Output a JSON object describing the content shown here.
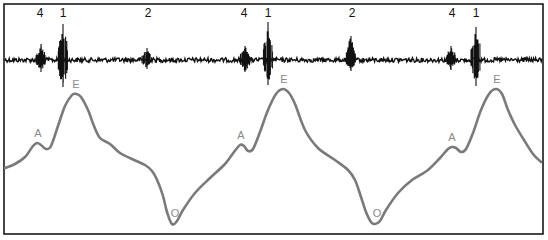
{
  "figure": {
    "frame": {
      "left": 4,
      "top": 4,
      "right": 543,
      "bottom": 234,
      "color": "#1a1a1a"
    },
    "trace": {
      "baseline_y": 60,
      "color": "#111111",
      "bursts": [
        {
          "label": "4",
          "x": 41,
          "amp_up": 16,
          "amp_down": 12
        },
        {
          "label": "1",
          "x": 63,
          "amp_up": 36,
          "amp_down": 27
        },
        {
          "label": "2",
          "x": 147,
          "amp_up": 12,
          "amp_down": 9
        },
        {
          "label": "4",
          "x": 245,
          "amp_up": 14,
          "amp_down": 12
        },
        {
          "label": "1",
          "x": 268,
          "amp_up": 38,
          "amp_down": 25
        },
        {
          "label": "2",
          "x": 351,
          "amp_up": 24,
          "amp_down": 11
        },
        {
          "label": "4",
          "x": 451,
          "amp_up": 14,
          "amp_down": 10
        },
        {
          "label": "1",
          "x": 476,
          "amp_up": 33,
          "amp_down": 26
        }
      ],
      "labels": [
        {
          "text": "4",
          "x": 40,
          "y": 17
        },
        {
          "text": "1",
          "x": 63,
          "y": 17
        },
        {
          "text": "2",
          "x": 148,
          "y": 17
        },
        {
          "text": "4",
          "x": 244,
          "y": 17
        },
        {
          "text": "1",
          "x": 268,
          "y": 17
        },
        {
          "text": "2",
          "x": 352,
          "y": 17
        },
        {
          "text": "4",
          "x": 452,
          "y": 17
        },
        {
          "text": "1",
          "x": 476,
          "y": 17
        }
      ]
    },
    "wave": {
      "color": "#7a7a7a",
      "stroke_width": 2.6,
      "points": [
        [
          5,
          168
        ],
        [
          15,
          164
        ],
        [
          25,
          157
        ],
        [
          33,
          146
        ],
        [
          37,
          143
        ],
        [
          41,
          145
        ],
        [
          46,
          149
        ],
        [
          51,
          146
        ],
        [
          58,
          126
        ],
        [
          65,
          106
        ],
        [
          72,
          95
        ],
        [
          76,
          94
        ],
        [
          81,
          97
        ],
        [
          88,
          110
        ],
        [
          94,
          126
        ],
        [
          100,
          138
        ],
        [
          110,
          144
        ],
        [
          120,
          153
        ],
        [
          132,
          159
        ],
        [
          145,
          165
        ],
        [
          152,
          171
        ],
        [
          158,
          182
        ],
        [
          163,
          196
        ],
        [
          167,
          212
        ],
        [
          172,
          224
        ],
        [
          177,
          221
        ],
        [
          183,
          210
        ],
        [
          195,
          193
        ],
        [
          210,
          178
        ],
        [
          225,
          164
        ],
        [
          234,
          152
        ],
        [
          240,
          145
        ],
        [
          244,
          146
        ],
        [
          248,
          151
        ],
        [
          253,
          149
        ],
        [
          260,
          132
        ],
        [
          268,
          110
        ],
        [
          276,
          94
        ],
        [
          283,
          89
        ],
        [
          289,
          93
        ],
        [
          295,
          104
        ],
        [
          305,
          130
        ],
        [
          318,
          148
        ],
        [
          335,
          160
        ],
        [
          348,
          170
        ],
        [
          355,
          180
        ],
        [
          361,
          197
        ],
        [
          366,
          212
        ],
        [
          371,
          222
        ],
        [
          375,
          224
        ],
        [
          380,
          221
        ],
        [
          386,
          210
        ],
        [
          398,
          193
        ],
        [
          412,
          180
        ],
        [
          428,
          170
        ],
        [
          440,
          158
        ],
        [
          448,
          149
        ],
        [
          452,
          147
        ],
        [
          456,
          148
        ],
        [
          461,
          152
        ],
        [
          466,
          149
        ],
        [
          473,
          133
        ],
        [
          481,
          110
        ],
        [
          489,
          94
        ],
        [
          496,
          89
        ],
        [
          502,
          94
        ],
        [
          508,
          110
        ],
        [
          515,
          125
        ],
        [
          524,
          140
        ],
        [
          533,
          154
        ],
        [
          541,
          162
        ]
      ],
      "labels": [
        {
          "text": "A",
          "x": 38,
          "y": 137
        },
        {
          "text": "E",
          "x": 76,
          "y": 88
        },
        {
          "text": "O",
          "x": 175,
          "y": 217
        },
        {
          "text": "A",
          "x": 241,
          "y": 139
        },
        {
          "text": "E",
          "x": 284,
          "y": 83
        },
        {
          "text": "O",
          "x": 377,
          "y": 217
        },
        {
          "text": "A",
          "x": 452,
          "y": 141
        },
        {
          "text": "E",
          "x": 497,
          "y": 83
        }
      ]
    }
  }
}
